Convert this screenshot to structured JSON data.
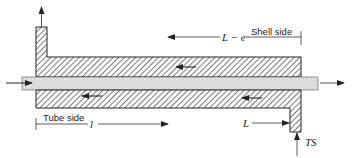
{
  "diagram": {
    "type": "heat-exchanger-cross-section",
    "labels": {
      "shell_side": "Shell side",
      "shell_length": "L − e",
      "tube_side": "Tube side",
      "tube_length": "l",
      "L": "L",
      "tube_sheet": "TS"
    },
    "colors": {
      "line": "#222222",
      "hatch": "#333333",
      "tube_fill": "#d9d9d9"
    },
    "flows": [
      {
        "name": "shell-inlet",
        "direction": "up",
        "note": "outlet at top-left nozzle"
      },
      {
        "name": "shell-flow-upper",
        "direction": "left"
      },
      {
        "name": "shell-flow-lower",
        "direction": "left"
      },
      {
        "name": "tube-flow",
        "direction": "right"
      }
    ]
  }
}
